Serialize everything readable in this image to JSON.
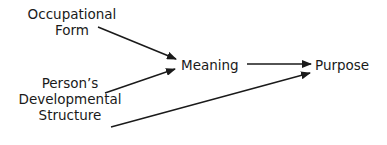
{
  "diagram": {
    "nodes": {
      "occupational_form": [
        "Occupational",
        "Form"
      ],
      "developmental_structure": [
        "Person’s",
        "Developmental",
        "Structure"
      ],
      "meaning": "Meaning",
      "purpose": "Purpose"
    },
    "edges": [
      {
        "from": "Occupational Form",
        "to": "Meaning"
      },
      {
        "from": "Person’s Developmental Structure",
        "to": "Meaning"
      },
      {
        "from": "Meaning",
        "to": "Purpose"
      },
      {
        "from": "Person’s Developmental Structure",
        "to": "Purpose"
      }
    ]
  }
}
